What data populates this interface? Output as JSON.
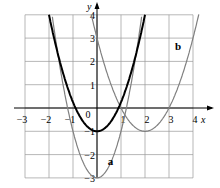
{
  "chart_data": {
    "type": "line",
    "title": "",
    "xlabel": "x",
    "ylabel": "y",
    "xlim": [
      -3,
      4
    ],
    "ylim": [
      -3,
      4
    ],
    "grid": true,
    "x_ticks": [
      "−3",
      "−2",
      "−1",
      "0",
      "1",
      "2",
      "3",
      "4"
    ],
    "y_ticks": [
      "−3",
      "−2",
      "−1",
      "1",
      "2",
      "3",
      "4"
    ],
    "series": [
      {
        "name": "base",
        "label": "",
        "color": "#000000",
        "equation": "y = x² − 1",
        "vertex": [
          0,
          -1
        ],
        "roots": [
          -1,
          1
        ]
      },
      {
        "name": "a",
        "label": "a",
        "color": "#808080",
        "vertex": [
          0,
          -3
        ],
        "roots": [
          -1.22,
          1.22
        ],
        "equation": "y = 2x² − 3"
      },
      {
        "name": "b",
        "label": "b",
        "color": "#808080",
        "vertex": [
          2,
          -1
        ],
        "roots": [
          1,
          3
        ],
        "equation": "y = (x − 2)² − 1"
      }
    ]
  },
  "labels": {
    "x": "x",
    "y": "y",
    "origin": "0",
    "a": "a",
    "b": "b"
  }
}
